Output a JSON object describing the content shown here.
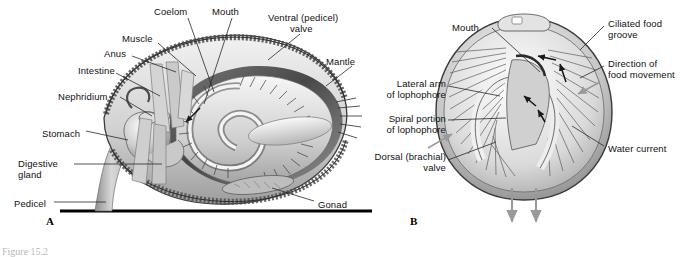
{
  "figure": {
    "title_fragment": "Figure 15.2",
    "panels": [
      {
        "id": "A",
        "label": "A",
        "x": 46,
        "y": 222
      },
      {
        "id": "B",
        "label": "B",
        "x": 410,
        "y": 222
      }
    ]
  },
  "panel_a": {
    "description": "Longitudinal section of a brachiopod (lamp shell) attached to substrate by pedicel",
    "labels": [
      {
        "name": "coelom",
        "text": "Coelom",
        "x": 154,
        "y": 6,
        "align": "left"
      },
      {
        "name": "mouth",
        "text": "Mouth",
        "x": 212,
        "y": 6,
        "align": "left"
      },
      {
        "name": "ventral-valve",
        "text": "Ventral (pedicel)\n        valve",
        "x": 268,
        "y": 12,
        "align": "left"
      },
      {
        "name": "muscle",
        "text": "Muscle",
        "x": 122,
        "y": 33,
        "align": "left"
      },
      {
        "name": "anus",
        "text": "Anus",
        "x": 104,
        "y": 48,
        "align": "left"
      },
      {
        "name": "mantle",
        "text": "Mantle",
        "x": 326,
        "y": 56,
        "align": "left"
      },
      {
        "name": "intestine",
        "text": "Intestine",
        "x": 78,
        "y": 65,
        "align": "left"
      },
      {
        "name": "nephridium",
        "text": "Nephridium",
        "x": 58,
        "y": 91,
        "align": "left"
      },
      {
        "name": "stomach",
        "text": "Stomach",
        "x": 42,
        "y": 128,
        "align": "left"
      },
      {
        "name": "digestive-gland",
        "text": "Digestive\ngland",
        "x": 18,
        "y": 158,
        "align": "left"
      },
      {
        "name": "pedicel",
        "text": "Pedicel",
        "x": 14,
        "y": 198,
        "align": "left"
      },
      {
        "name": "gonad",
        "text": "Gonad",
        "x": 318,
        "y": 199,
        "align": "left"
      }
    ]
  },
  "panel_b": {
    "description": "Anterior view of brachiopod with valves open showing lophophore and water currents",
    "labels": [
      {
        "name": "mouth",
        "text": "Mouth",
        "x": 452,
        "y": 22,
        "align": "left"
      },
      {
        "name": "ciliated-food-groove",
        "text": "Ciliated food\ngroove",
        "x": 608,
        "y": 18,
        "align": "left"
      },
      {
        "name": "direction-food",
        "text": "Direction of\nfood movement",
        "x": 608,
        "y": 58,
        "align": "left"
      },
      {
        "name": "lateral-arm",
        "text": "Lateral arm\nof lophophore",
        "x": 386,
        "y": 78,
        "align": "left"
      },
      {
        "name": "spiral-portion",
        "text": "Spiral portion\nof lophophore",
        "x": 381,
        "y": 113,
        "align": "left"
      },
      {
        "name": "water-current",
        "text": "Water current",
        "x": 608,
        "y": 143,
        "align": "left"
      },
      {
        "name": "dorsal-valve",
        "text": "Dorsal (brachial)\n      valve",
        "x": 374,
        "y": 151,
        "align": "left"
      }
    ]
  },
  "colors": {
    "ink": "#111111",
    "leader": "#2a2a2a",
    "shell_light": "#e8e8e8",
    "shell_mid": "#bfbfbf",
    "shell_dark": "#8a8a8a",
    "tissue": "#d6d6d6",
    "arrow_gray": "#9a9a9a",
    "substrate": "#000000"
  }
}
